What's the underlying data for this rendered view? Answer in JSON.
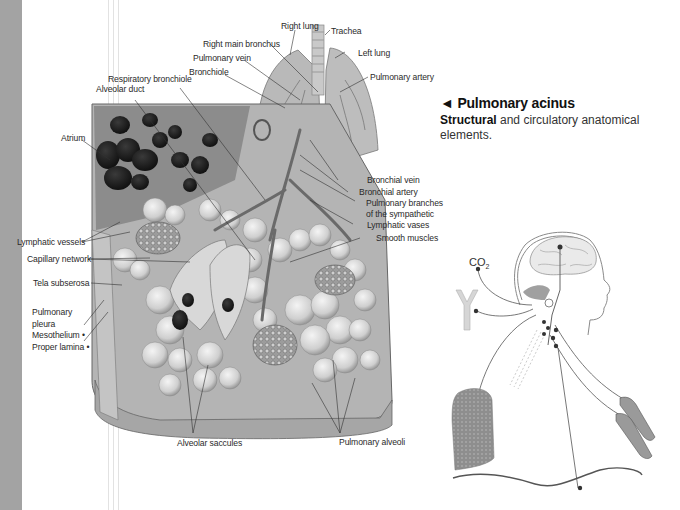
{
  "page": {
    "side_band_color": "#a3a3a3"
  },
  "labels": {
    "right_lung": "Right lung",
    "trachea": "Trachea",
    "right_main_bronchus": "Right main bronchus",
    "left_lung": "Left lung",
    "pulmonary_vein": "Pulmonary vein",
    "pulmonary_artery": "Pulmonary artery",
    "bronchiole": "Bronchiole",
    "respiratory_bronchiole": "Respiratory bronchiole",
    "alveolar_duct": "Alveolar duct",
    "atrium": "Atrium",
    "bronchial_vein": "Bronchial vein",
    "bronchial_artery": "Bronchial artery",
    "pulmonary_branches_1": "Pulmonary branches",
    "pulmonary_branches_2": "of the sympathetic",
    "lymphatic_vases": "Lymphatic vases",
    "smooth_muscles": "Smooth muscles",
    "lymphatic_vessels": "Lymphatic vessels",
    "capillary_network": "Capillary network",
    "tela_subserosa": "Tela subserosa",
    "pulmonary_pleura_1": "Pulmonary",
    "pulmonary_pleura_2": "pleura",
    "mesothelium": "Mesothelium •",
    "proper_lamina": "Proper lamina •",
    "alveolar_saccules": "Alveolar saccules",
    "pulmonary_alveoli": "Pulmonary alveoli"
  },
  "caption": {
    "arrow": "◄",
    "title": "Pulmonary acinus",
    "desc_bold": "Structural",
    "desc_rest": " and circulatory anatomical elements."
  },
  "diagram": {
    "co2_main": "CO",
    "co2_sub": "2"
  }
}
